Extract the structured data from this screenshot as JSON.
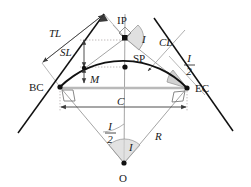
{
  "figure": {
    "colors": {
      "curve": "#111111",
      "tangent": "#111111",
      "construction": "#9a9a9a",
      "chord": "#b9b9b9",
      "dimension": "#3a3a3a",
      "dotted": "#b0a8a8",
      "angle_fill": "#cfcfcf",
      "text": "#1a1a1a",
      "background": "#ffffff"
    }
  },
  "points": {
    "ip": {
      "label": "IP",
      "x": 125,
      "y": 38,
      "label_x": 117,
      "label_y": 24
    },
    "sp": {
      "label": "SP",
      "x": 125,
      "y": 67,
      "label_x": 133,
      "label_y": 62
    },
    "bc": {
      "label": "BC",
      "x": 60,
      "y": 87,
      "label_x": 31,
      "label_y": 91
    },
    "ec": {
      "label": "EC",
      "x": 187,
      "y": 88,
      "label_x": 196,
      "label_y": 92
    },
    "o": {
      "label": "O",
      "x": 124,
      "y": 163,
      "label_x": 120,
      "label_y": 181
    },
    "m_anchor": {
      "label": "M",
      "x": 84,
      "y": 74,
      "label_x": 90,
      "label_y": 80
    }
  },
  "labels": {
    "tl": {
      "text": "TL",
      "x": 56,
      "y": 36
    },
    "sl": {
      "text": "SL",
      "x": 65,
      "y": 55
    },
    "m": {
      "text": "M",
      "x": 91,
      "y": 81
    },
    "cl": {
      "text": "CL",
      "x": 162,
      "y": 45
    },
    "c": {
      "text": "C",
      "x": 118,
      "y": 107
    },
    "r": {
      "text": "R",
      "x": 157,
      "y": 137
    },
    "i_ip": {
      "text": "I",
      "x": 143,
      "y": 42
    },
    "i_o": {
      "text": "I",
      "x": 130,
      "y": 149
    },
    "i_half_ec": {
      "num": "I",
      "den": "2",
      "x": 190,
      "y": 63
    },
    "i_half_o": {
      "num": "I",
      "den": "2",
      "x": 110,
      "y": 131
    }
  },
  "dimensions": {
    "tl_arrow": {
      "x1": 42,
      "y1": 63,
      "x2": 104,
      "y2": 14,
      "both_ends": true
    },
    "sl_arrow": {
      "x": 84,
      "y1": 40,
      "y2": 67,
      "both_ends": true
    },
    "m_arrow": {
      "x": 84,
      "y1": 68,
      "y2": 82,
      "both_ends": true
    },
    "c_arrow": {
      "y": 107,
      "x1": 60,
      "x2": 187,
      "both_ends": true
    }
  },
  "geometry": {
    "radius": 89,
    "center": {
      "x": 124,
      "y": 163
    },
    "arc": {
      "start_x": 60,
      "start_y": 87,
      "end_x": 187,
      "end_y": 88,
      "sweep": 1
    },
    "tangent_left": {
      "x1": 18,
      "y1": 133,
      "x2": 104,
      "y2": 14
    },
    "tangent_right": {
      "x1": 154,
      "y1": 18,
      "x2": 233,
      "y2": 131
    }
  }
}
